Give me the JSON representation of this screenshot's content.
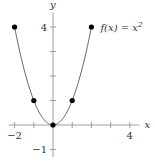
{
  "chart_data": {
    "type": "line",
    "title": "",
    "xlabel": "x",
    "ylabel": "y",
    "xlim": [
      -2.3,
      4.5
    ],
    "ylim": [
      -1.3,
      4.6
    ],
    "x_ticks": [
      -2,
      -1,
      0,
      1,
      2,
      3,
      4
    ],
    "y_ticks": [
      -1,
      0,
      1,
      2,
      3,
      4
    ],
    "x_tick_labels": [
      {
        "value": -2,
        "label": "−2"
      },
      {
        "value": 4,
        "label": "4"
      }
    ],
    "y_tick_labels": [
      {
        "value": 4,
        "label": "4"
      },
      {
        "value": -1,
        "label": "−1"
      }
    ],
    "series": [
      {
        "name": "f(x) = x^2",
        "function": "x^2",
        "domain": [
          -2,
          2
        ],
        "points": [
          {
            "x": -2,
            "y": 4
          },
          {
            "x": -1,
            "y": 1
          },
          {
            "x": 0,
            "y": 0
          },
          {
            "x": 1,
            "y": 1
          },
          {
            "x": 2,
            "y": 4
          }
        ]
      }
    ],
    "annotation": {
      "text_prefix": "f(x) = x",
      "superscript": "2",
      "anchor": {
        "x": 2,
        "y": 4
      }
    },
    "grid": false,
    "legend": "none"
  }
}
